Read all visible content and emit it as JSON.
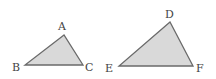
{
  "diagram": {
    "triangles": [
      {
        "name": "ABC",
        "vertices": [
          "A",
          "B",
          "C"
        ]
      },
      {
        "name": "DEF",
        "vertices": [
          "D",
          "E",
          "F"
        ]
      }
    ],
    "labels": {
      "A": "A",
      "B": "B",
      "C": "C",
      "D": "D",
      "E": "E",
      "F": "F"
    },
    "colors": {
      "fill": "#d9d9d9",
      "stroke": "#6a6a6a",
      "text": "#444444"
    }
  }
}
